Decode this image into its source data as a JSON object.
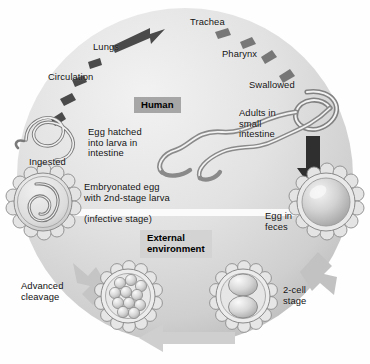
{
  "diagram": {
    "background_color": "#ffffff",
    "circle_color_light": "#eeeeee",
    "circle_color_dark": "#b9b9b9",
    "arrow_dark_color": "#3b3b3b",
    "arrow_light_color": "#c4c4c4",
    "text_color": "#111111"
  },
  "labels": {
    "trachea": "Trachea",
    "lungs": "Lungs",
    "circulation": "Circulation",
    "pharynx": "Pharynx",
    "swallowed": "Swallowed",
    "ingested": "Ingested",
    "egg_hatched": "Egg hatched\ninto larva in\nintestine",
    "adults_small_intestine": "Adults in\nsmall\nintestine",
    "embryonated_egg": "Embryonated egg\nwith 2nd-stage larva",
    "infective_stage": "(infective stage)",
    "egg_in_feces": "Egg in\nfeces",
    "two_cell_stage": "2-cell\nstage",
    "advanced_cleavage": "Advanced\ncleavage"
  },
  "boxes": {
    "human": "Human",
    "external_environment": "External\nenvironment"
  },
  "stages": [
    {
      "name": "adult-worms",
      "label": "Adults in small intestine"
    },
    {
      "name": "egg-in-feces",
      "label": "Egg in feces"
    },
    {
      "name": "two-cell-egg",
      "label": "2-cell stage"
    },
    {
      "name": "morula-egg",
      "label": "Advanced cleavage"
    },
    {
      "name": "embryonated-egg",
      "label": "Embryonated egg with 2nd-stage larva (infective stage)"
    },
    {
      "name": "larva-in-intestine",
      "label": "Egg hatched into larva in intestine"
    }
  ],
  "pathway": [
    "Ingested",
    "Egg hatched into larva in intestine",
    "Circulation",
    "Lungs",
    "Trachea",
    "Pharynx",
    "Swallowed",
    "Adults in small intestine"
  ]
}
